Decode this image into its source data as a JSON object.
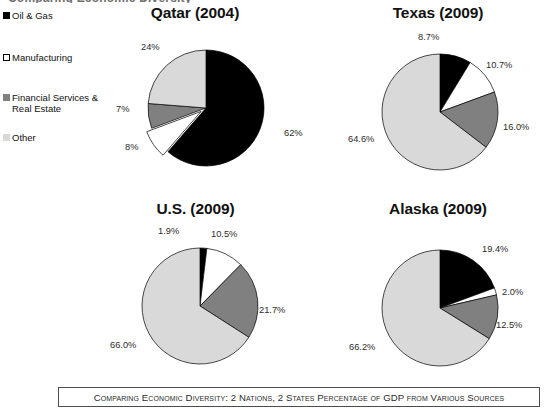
{
  "clipped_title": "Comparing Economic Diversity",
  "legend": {
    "items": [
      {
        "label": "Oil & Gas",
        "swatch": "black-square-swatch",
        "color": "#000000"
      },
      {
        "label": "Manufacturing",
        "swatch": "white-square-swatch",
        "color": "#ffffff"
      },
      {
        "label": "Financial Services & Real Estate",
        "swatch": "gray-square-swatch",
        "color": "#808080"
      },
      {
        "label": "Other",
        "swatch": "light-gray-square-swatch",
        "color": "#d9d9d9"
      }
    ]
  },
  "caption": "Comparing Economic Diversity: 2 Nations, 2 States Percentage of GDP from Various Sources",
  "chart_data": [
    {
      "type": "pie",
      "title": "Qatar (2004)",
      "categories": [
        "Oil & Gas",
        "Manufacturing",
        "Financial Services & Real Estate",
        "Other"
      ],
      "values": [
        62,
        8,
        7,
        24
      ],
      "labels": [
        "62%",
        "8%",
        "7%",
        "24%"
      ],
      "colors": [
        "#000000",
        "#ffffff",
        "#808080",
        "#d9d9d9"
      ],
      "exploded": [
        false,
        true,
        false,
        false
      ],
      "start_angle": 0,
      "direction": "clockwise",
      "legend_position": "left"
    },
    {
      "type": "pie",
      "title": "Texas (2009)",
      "categories": [
        "Oil & Gas",
        "Manufacturing",
        "Financial Services & Real Estate",
        "Other"
      ],
      "values": [
        8.7,
        10.7,
        16.0,
        64.6
      ],
      "labels": [
        "8.7%",
        "10.7%",
        "16.0%",
        "64.6%"
      ],
      "colors": [
        "#000000",
        "#ffffff",
        "#808080",
        "#d9d9d9"
      ],
      "exploded": [
        false,
        false,
        false,
        false
      ],
      "start_angle": 0,
      "direction": "clockwise",
      "legend_position": "left"
    },
    {
      "type": "pie",
      "title": "U.S. (2009)",
      "categories": [
        "Oil & Gas",
        "Manufacturing",
        "Financial Services & Real Estate",
        "Other"
      ],
      "values": [
        1.9,
        10.5,
        21.7,
        66.0
      ],
      "labels": [
        "1.9%",
        "10.5%",
        "21.7%",
        "66.0%"
      ],
      "colors": [
        "#000000",
        "#ffffff",
        "#808080",
        "#d9d9d9"
      ],
      "exploded": [
        false,
        false,
        false,
        false
      ],
      "start_angle": 0,
      "direction": "clockwise",
      "legend_position": "left"
    },
    {
      "type": "pie",
      "title": "Alaska (2009)",
      "categories": [
        "Oil & Gas",
        "Manufacturing",
        "Financial Services & Real Estate",
        "Other"
      ],
      "values": [
        19.4,
        2.0,
        12.5,
        66.2
      ],
      "labels": [
        "19.4%",
        "2.0%",
        "12.5%",
        "66.2%"
      ],
      "colors": [
        "#000000",
        "#ffffff",
        "#808080",
        "#d9d9d9"
      ],
      "exploded": [
        false,
        false,
        false,
        false
      ],
      "start_angle": 0,
      "direction": "clockwise",
      "legend_position": "left"
    }
  ],
  "label_layout": [
    [
      {
        "label": "62%",
        "x": 152,
        "y": 94
      },
      {
        "label": "8%",
        "x": -7,
        "y": 108
      },
      {
        "label": "7%",
        "x": -16,
        "y": 70
      },
      {
        "label": "24%",
        "x": 9,
        "y": 8
      }
    ],
    [
      {
        "label": "8.7%",
        "x": 52,
        "y": -6
      },
      {
        "label": "10.7%",
        "x": 120,
        "y": 22
      },
      {
        "label": "16.0%",
        "x": 137,
        "y": 84
      },
      {
        "label": "64.6%",
        "x": -18,
        "y": 96
      }
    ],
    [
      {
        "label": "1.9%",
        "x": 32,
        "y": -6
      },
      {
        "label": "10.5%",
        "x": 85,
        "y": -3
      },
      {
        "label": "21.7%",
        "x": 133,
        "y": 73
      },
      {
        "label": "66.0%",
        "x": -16,
        "y": 108
      }
    ],
    [
      {
        "label": "19.4%",
        "x": 116,
        "y": 10
      },
      {
        "label": "2.0%",
        "x": 136,
        "y": 53
      },
      {
        "label": "12.5%",
        "x": 130,
        "y": 86
      },
      {
        "label": "66.2%",
        "x": -17,
        "y": 108
      }
    ]
  ]
}
